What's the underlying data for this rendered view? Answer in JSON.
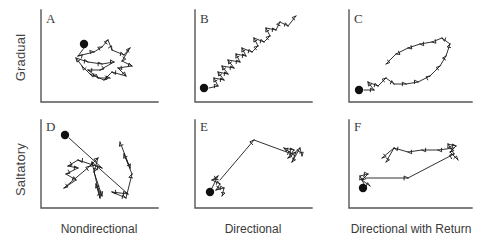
{
  "figure": {
    "type": "multi-panel-trajectory-figure",
    "rows": 2,
    "columns": 3,
    "row_labels": [
      "Gradual",
      "Saltatory"
    ],
    "column_labels": [
      "Nondirectional",
      "Directional",
      "Directional with Return"
    ],
    "axis_color": "#555555",
    "track_color": "#1a1a1a",
    "start_marker_color": "#101010",
    "background": "#ffffff"
  },
  "panels": [
    {
      "id": "A",
      "letter": "A",
      "row": "Gradual",
      "column": "Nondirectional",
      "description": "Dense tangled cluster of short arrow steps around the start point; no net displacement.",
      "start_marker": true,
      "movement_mode": "gradual",
      "path_type": "nondirectional"
    },
    {
      "id": "B",
      "letter": "B",
      "row": "Gradual",
      "column": "Directional",
      "description": "Zigzag sequence of short steps progressing steadily from lower-left to upper-right.",
      "start_marker": true,
      "movement_mode": "gradual",
      "path_type": "directional"
    },
    {
      "id": "C",
      "letter": "C",
      "row": "Gradual",
      "column": "Directional with Return",
      "description": "Short steps travel out to the upper right then loop back leftwards, forming an elongated return loop.",
      "start_marker": true,
      "movement_mode": "gradual",
      "path_type": "directional-with-return"
    },
    {
      "id": "D",
      "letter": "D",
      "row": "Saltatory",
      "column": "Nondirectional",
      "description": "Long jumps crossing one another in many directions with small arrow clusters at the stopping points.",
      "start_marker": true,
      "movement_mode": "saltatory",
      "path_type": "nondirectional"
    },
    {
      "id": "E",
      "letter": "E",
      "row": "Saltatory",
      "column": "Directional",
      "description": "Small cluster at the start, one long jump up to an apex, then a long jump right to a second small cluster.",
      "start_marker": true,
      "movement_mode": "saltatory",
      "path_type": "directional"
    },
    {
      "id": "F",
      "letter": "F",
      "row": "Saltatory",
      "column": "Directional with Return",
      "description": "Long rightward jump from the start cluster, up to a far cluster, then stepped return back toward the left.",
      "start_marker": true,
      "movement_mode": "saltatory",
      "path_type": "directional-with-return"
    }
  ]
}
